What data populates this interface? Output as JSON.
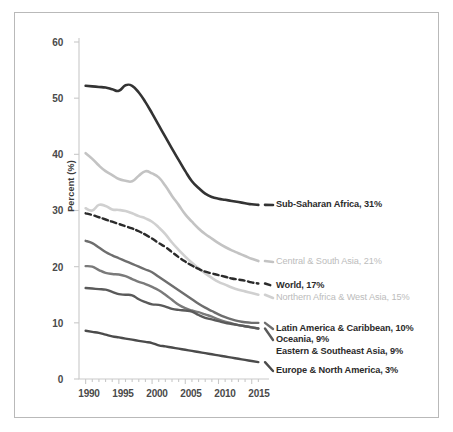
{
  "chart_data": {
    "type": "line",
    "title": "",
    "xlabel": "",
    "ylabel": "Percent (%)",
    "xlim": [
      1989,
      2017
    ],
    "ylim": [
      0,
      60
    ],
    "grid": false,
    "legend_position": "right-inline-annotations",
    "yticks": [
      "0",
      "10",
      "20",
      "30",
      "40",
      "50",
      "60"
    ],
    "xticks": [
      "1990",
      "1995",
      "2000",
      "2005",
      "2010",
      "2015"
    ],
    "x": [
      1990,
      1991,
      1992,
      1993,
      1994,
      1995,
      1996,
      1997,
      1998,
      1999,
      2000,
      2001,
      2002,
      2003,
      2004,
      2005,
      2006,
      2007,
      2008,
      2009,
      2010,
      2011,
      2012,
      2013,
      2014,
      2015,
      2016
    ],
    "series": [
      {
        "name": "Sub-Saharan Africa",
        "end_value": 31,
        "color": "#333333",
        "style": "solid",
        "width": 2.6,
        "values": [
          52.2,
          52.1,
          52.0,
          51.9,
          51.6,
          51.3,
          52.3,
          52.2,
          51.0,
          49.3,
          47.3,
          45.2,
          43.1,
          41.0,
          39.0,
          37.0,
          35.2,
          34.0,
          33.0,
          32.4,
          32.1,
          31.9,
          31.7,
          31.5,
          31.3,
          31.1,
          31.0
        ]
      },
      {
        "name": "Central & South Asia",
        "end_value": 21,
        "color": "#c3c3c3",
        "style": "solid",
        "width": 2.6,
        "values": [
          40.2,
          39.2,
          38.0,
          37.0,
          36.3,
          35.6,
          35.3,
          35.2,
          36.2,
          37.0,
          36.6,
          35.9,
          34.4,
          32.6,
          31.0,
          29.3,
          28.0,
          26.8,
          25.8,
          25.0,
          24.2,
          23.5,
          22.9,
          22.4,
          21.9,
          21.4,
          21.0
        ]
      },
      {
        "name": "World",
        "end_value": 17,
        "color": "#2b2b2b",
        "style": "dashed",
        "width": 2.4,
        "values": [
          29.5,
          29.2,
          28.8,
          28.4,
          28.0,
          27.6,
          27.2,
          26.8,
          26.3,
          25.7,
          25.0,
          24.2,
          23.5,
          22.6,
          21.7,
          20.9,
          20.2,
          19.6,
          19.1,
          18.8,
          18.5,
          18.2,
          17.9,
          17.7,
          17.5,
          17.2,
          17.0
        ]
      },
      {
        "name": "Northern Africa & West Asia",
        "end_value": 15,
        "color": "#d0d0d0",
        "style": "solid",
        "width": 2.6,
        "values": [
          30.4,
          30.0,
          31.0,
          30.8,
          30.2,
          30.1,
          29.9,
          29.5,
          29.0,
          28.6,
          28.0,
          27.0,
          25.8,
          24.3,
          23.0,
          21.8,
          20.7,
          19.7,
          18.8,
          18.0,
          17.3,
          16.8,
          16.3,
          15.9,
          15.6,
          15.3,
          15.0
        ]
      },
      {
        "name": "Latin America & Caribbean",
        "end_value": 10,
        "color": "#6e6e6e",
        "style": "solid",
        "width": 2.4,
        "values": [
          24.6,
          24.2,
          23.4,
          22.6,
          22.0,
          21.5,
          21.0,
          20.5,
          20.0,
          19.5,
          19.0,
          18.2,
          17.4,
          16.6,
          15.8,
          15.0,
          14.2,
          13.4,
          12.7,
          12.1,
          11.5,
          11.0,
          10.6,
          10.3,
          10.1,
          10.0,
          10.0
        ]
      },
      {
        "name": "Oceania",
        "end_value": 9,
        "color": "#7a7a7a",
        "style": "solid",
        "width": 2.4,
        "values": [
          20.1,
          20.0,
          19.4,
          18.9,
          18.7,
          18.6,
          18.3,
          17.8,
          17.3,
          16.9,
          16.4,
          15.8,
          15.0,
          14.1,
          13.2,
          12.6,
          12.2,
          11.9,
          11.5,
          11.1,
          10.6,
          10.2,
          9.9,
          9.6,
          9.4,
          9.2,
          9.0
        ]
      },
      {
        "name": "Eastern & Southeast Asia",
        "end_value": 9,
        "color": "#5a5a5a",
        "style": "solid",
        "width": 2.4,
        "values": [
          16.2,
          16.1,
          16.0,
          15.9,
          15.5,
          15.1,
          15.0,
          14.9,
          14.2,
          13.7,
          13.3,
          13.2,
          12.9,
          12.5,
          12.3,
          12.2,
          12.0,
          11.4,
          10.9,
          10.6,
          10.3,
          10.0,
          9.8,
          9.6,
          9.4,
          9.2,
          9.0
        ]
      },
      {
        "name": "Europe & North America",
        "end_value": 3,
        "color": "#4b4b4b",
        "style": "solid",
        "width": 2.4,
        "values": [
          8.6,
          8.4,
          8.2,
          7.9,
          7.6,
          7.4,
          7.2,
          7.0,
          6.8,
          6.6,
          6.4,
          6.0,
          5.8,
          5.6,
          5.4,
          5.2,
          5.0,
          4.8,
          4.6,
          4.4,
          4.2,
          4.0,
          3.8,
          3.6,
          3.4,
          3.2,
          3.0
        ]
      }
    ]
  },
  "axes": {
    "ylabel": "Percent (%)",
    "yticks": [
      "60",
      "50",
      "40",
      "30",
      "20",
      "10",
      "0"
    ],
    "xticks": [
      "1990",
      "1995",
      "2000",
      "2005",
      "2010",
      "2015"
    ]
  },
  "annotations": {
    "sub_saharan_africa": "Sub-Saharan Africa, 31%",
    "central_south_asia": "Central & South Asia, 21%",
    "world": "World, 17%",
    "northern_africa_west_asia": "Northern Africa & West Asia, 15%",
    "latin_america_caribbean": "Latin America & Caribbean, 10%",
    "oceania": "Oceania, 9%",
    "eastern_southeast_asia": "Eastern & Southeast Asia, 9%",
    "europe_north_america": "Europe & North America, 3%"
  },
  "colors": {
    "sub_saharan_africa": "#333333",
    "central_south_asia": "#c3c3c3",
    "world": "#2b2b2b",
    "northern_africa_west_asia": "#d0d0d0",
    "latin_america_caribbean": "#6e6e6e",
    "oceania": "#7a7a7a",
    "eastern_southeast_asia": "#5a5a5a",
    "europe_north_america": "#4b4b4b",
    "frame_border": "#b9b9b9",
    "axis_line": "#c9c9c9",
    "tick_text": "#4a4a4a"
  }
}
